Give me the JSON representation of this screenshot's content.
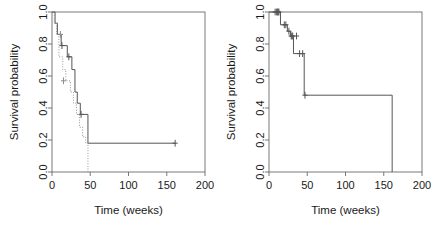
{
  "figure": {
    "width": 434,
    "height": 231,
    "background": "#ffffff",
    "panel_count": 2
  },
  "chart_data": [
    {
      "type": "line",
      "subtype": "kaplan-meier-step",
      "panel": "left",
      "title": "",
      "xlabel": "Time (weeks)",
      "ylabel": "Survival probability",
      "xlim": [
        0,
        200
      ],
      "ylim": [
        0,
        1
      ],
      "xticks": [
        0,
        50,
        100,
        150,
        200
      ],
      "xticklabels": [
        "0",
        "50",
        "100",
        "150",
        "200"
      ],
      "yticks": [
        0.0,
        0.2,
        0.4,
        0.6,
        0.8,
        1.0
      ],
      "yticklabels": [
        "0.0",
        "0.2",
        "0.4",
        "0.6",
        "0.8",
        "1.0"
      ],
      "grid": false,
      "legend": "none",
      "line_color": "#555555",
      "series": [
        {
          "name": "group-1-solid",
          "linestyle": "solid",
          "color": "#555555",
          "x": [
            0,
            4,
            4,
            7,
            7,
            12,
            12,
            20,
            20,
            26,
            26,
            30,
            30,
            33,
            33,
            37,
            37,
            47,
            47,
            161
          ],
          "y": [
            1.0,
            1.0,
            0.93,
            0.93,
            0.86,
            0.86,
            0.79,
            0.79,
            0.72,
            0.72,
            0.64,
            0.64,
            0.5,
            0.5,
            0.43,
            0.43,
            0.36,
            0.36,
            0.18,
            0.18
          ],
          "censor_x": [
            13,
            22,
            38,
            161
          ],
          "censor_y": [
            0.79,
            0.72,
            0.36,
            0.18
          ]
        },
        {
          "name": "group-2-dotted",
          "linestyle": "dotted",
          "color": "#8a8a8a",
          "x": [
            0,
            3,
            3,
            6,
            6,
            9,
            9,
            14,
            14,
            18,
            18,
            24,
            24,
            28,
            28,
            32,
            32,
            36,
            36,
            40,
            40,
            44,
            44,
            47,
            47
          ],
          "y": [
            1.0,
            1.0,
            0.93,
            0.93,
            0.86,
            0.86,
            0.72,
            0.72,
            0.64,
            0.64,
            0.57,
            0.57,
            0.5,
            0.5,
            0.43,
            0.43,
            0.36,
            0.36,
            0.28,
            0.28,
            0.22,
            0.22,
            0.18,
            0.18,
            0.0
          ],
          "censor_x": [
            11,
            15
          ],
          "censor_y": [
            0.86,
            0.57
          ]
        }
      ]
    },
    {
      "type": "line",
      "subtype": "kaplan-meier-step",
      "panel": "right",
      "title": "",
      "xlabel": "Time (weeks)",
      "ylabel": "Survival probability",
      "xlim": [
        0,
        200
      ],
      "ylim": [
        0,
        1
      ],
      "xticks": [
        0,
        50,
        100,
        150,
        200
      ],
      "xticklabels": [
        "0",
        "50",
        "100",
        "150",
        "200"
      ],
      "yticks": [
        0.0,
        0.2,
        0.4,
        0.6,
        0.8,
        1.0
      ],
      "yticklabels": [
        "0.0",
        "0.2",
        "0.4",
        "0.6",
        "0.8",
        "1.0"
      ],
      "grid": false,
      "legend": "none",
      "line_color": "#555555",
      "series": [
        {
          "name": "overall-survival",
          "linestyle": "solid",
          "color": "#555555",
          "x": [
            0,
            15,
            15,
            24,
            24,
            28,
            28,
            32,
            32,
            46,
            46,
            161,
            161
          ],
          "y": [
            1.0,
            1.0,
            0.92,
            0.92,
            0.88,
            0.88,
            0.85,
            0.85,
            0.74,
            0.74,
            0.48,
            0.48,
            0.0
          ],
          "censor_x": [
            8,
            10,
            11,
            12,
            13,
            20,
            22,
            26,
            29,
            30,
            31,
            36,
            40,
            44,
            47
          ],
          "censor_y": [
            1.0,
            1.0,
            1.0,
            1.0,
            1.0,
            0.92,
            0.92,
            0.88,
            0.85,
            0.85,
            0.85,
            0.85,
            0.74,
            0.74,
            0.48
          ]
        }
      ]
    }
  ]
}
